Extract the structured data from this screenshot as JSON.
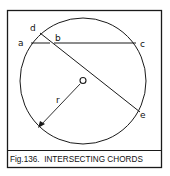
{
  "figure": {
    "caption": "Fig.136.  INTERSECTING CHORDS",
    "labels": {
      "a": "a",
      "b": "b",
      "c": "c",
      "d": "d",
      "e": "e",
      "center": "O",
      "radius": "r"
    },
    "colors": {
      "stroke": "#1a1a1a",
      "background": "#ffffff"
    }
  }
}
